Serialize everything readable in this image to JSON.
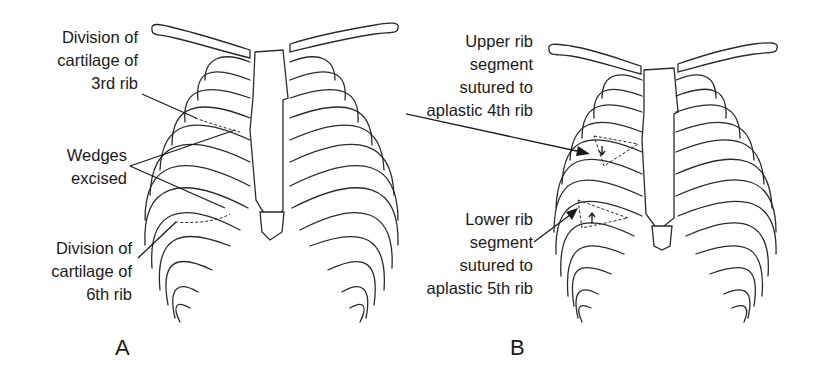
{
  "figure": {
    "panels": [
      {
        "id": "A",
        "letter": "A",
        "labels": [
          {
            "id": "division-3rd",
            "lines": [
              "Division of",
              "cartilage of",
              "3rd rib"
            ]
          },
          {
            "id": "wedges",
            "lines": [
              "Wedges",
              "excised"
            ]
          },
          {
            "id": "division-6th",
            "lines": [
              "Division of",
              "cartilage of",
              "6th rib"
            ]
          }
        ]
      },
      {
        "id": "B",
        "letter": "B",
        "labels": [
          {
            "id": "upper-segment",
            "lines": [
              "Upper rib",
              "segment",
              "sutured to",
              "aplastic 4th rib"
            ]
          },
          {
            "id": "lower-segment",
            "lines": [
              "Lower rib",
              "segment",
              "sutured to",
              "aplastic 5th rib"
            ]
          }
        ]
      }
    ],
    "colors": {
      "line": "#2a2a2a",
      "text": "#1a1a1a",
      "background": "#ffffff"
    }
  }
}
